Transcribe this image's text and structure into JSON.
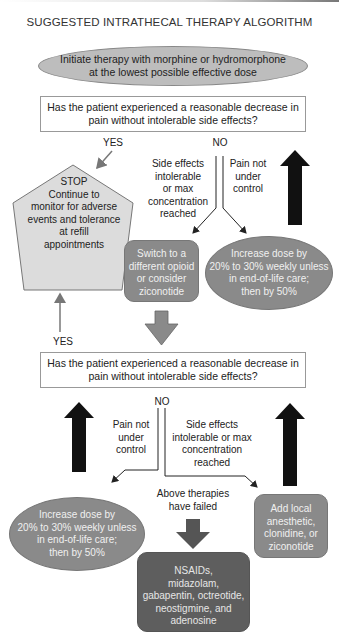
{
  "title": "SUGGESTED INTRATHECAL THERAPY ALGORITHM",
  "start": {
    "lines": [
      "Initiate therapy with morphine or hydromorphone",
      "at the lowest possible effective dose"
    ]
  },
  "question1": {
    "lines": [
      "Has the patient experienced a reasonable decrease in",
      "pain without intolerable side effects?"
    ]
  },
  "branch1": {
    "yes_label": "YES",
    "no_label": "NO",
    "side_effects_lines": [
      "Side effects",
      "intolerable",
      "or max",
      "concentration",
      "reached"
    ],
    "pain_lines": [
      "Pain not",
      "under",
      "control"
    ]
  },
  "stop": {
    "lines": [
      "STOP",
      "Continue to",
      "monitor for adverse",
      "events and tolerance",
      "at refill",
      "appointments"
    ]
  },
  "switch_opioid": {
    "lines": [
      "Switch to a",
      "different opioid",
      "or consider",
      "ziconotide"
    ]
  },
  "increase_dose_1": {
    "lines": [
      "Increase dose by",
      "20% to 30% weekly unless",
      "in end-of-life care;",
      "then by 50%"
    ]
  },
  "yes_label_2": "YES",
  "question2": {
    "lines": [
      "Has the patient experienced a reasonable decrease in",
      "pain without intolerable side effects?"
    ]
  },
  "branch2": {
    "no_label": "NO",
    "pain_lines": [
      "Pain not",
      "under",
      "control"
    ],
    "side_effects_lines": [
      "Side effects",
      "intolerable or max",
      "concentration",
      "reached"
    ],
    "failed_lines": [
      "Above therapies",
      "have failed"
    ]
  },
  "increase_dose_2": {
    "lines": [
      "Increase dose by",
      "20% to 30% weekly unless",
      "in end-of-life care;",
      "then by 50%"
    ]
  },
  "add_local": {
    "lines": [
      "Add local",
      "anesthetic,",
      "clonidine, or",
      "ziconotide"
    ]
  },
  "final_options": {
    "lines": [
      "NSAIDs,",
      "midazolam,",
      "gabapentin, octreotide,",
      "neostigmine, and",
      "adenosine"
    ]
  },
  "colors": {
    "oval_fill": "#bdbdbd",
    "pentagon_fill": "#dcdcdc",
    "medium_gray_fill": "#8a8a8a",
    "dark_gray_fill": "#5e5e5e",
    "thick_arrow": "#111111",
    "thin_arrow": "#777777"
  }
}
